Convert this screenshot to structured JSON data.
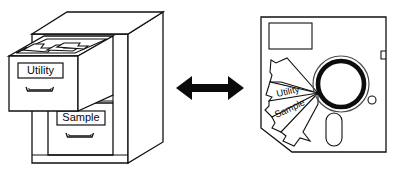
{
  "figure": {
    "background_color": "#ffffff",
    "line_color": "#111111",
    "arrow_color": "#0a0a0a"
  },
  "cabinet": {
    "name": "file-cabinet",
    "open_drawer": {
      "label": "Utility",
      "folder_tab_count": 3,
      "handle": "drawer-handle"
    },
    "closed_drawer": {
      "label": "Sample",
      "handle": "drawer-handle"
    }
  },
  "arrow": {
    "name": "double-headed-arrow",
    "direction": "bidirectional",
    "label": ""
  },
  "floppy": {
    "name": "floppy-disk",
    "size_label": "",
    "label_area": "",
    "write_protect_notch": "",
    "hub_ring": "",
    "index_hole": "",
    "shutter_slot": "",
    "fan_folders": [
      {
        "label": "Utility"
      },
      {
        "label": "Sample"
      },
      {
        "label": ""
      },
      {
        "label": ""
      },
      {
        "label": ""
      }
    ]
  }
}
